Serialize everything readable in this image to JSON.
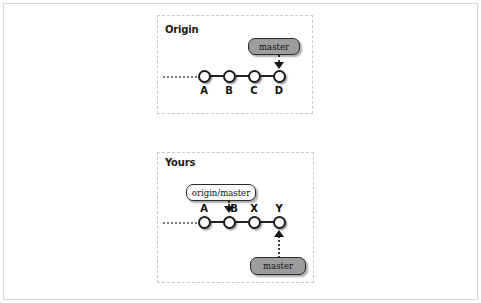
{
  "figure": {
    "width": 481,
    "height": 303,
    "background": "#ffffff",
    "frame_color": "#d8d8d8"
  },
  "colors": {
    "node_fill": "#ffffff",
    "node_stroke": "#1c1c1c",
    "edge": "#222222",
    "pill_filled": "#9d9d9d",
    "pill_hollow": "#fbfbfb",
    "pill_stroke": "#2b2b2b",
    "dashed_group": "#c9c9c9",
    "dotted_pointer": "#3a3a3a",
    "lead_dots": "#7a7a7a",
    "text": "#111111"
  },
  "groups": [
    {
      "id": "origin",
      "title": "Origin",
      "commits": [
        {
          "label": "A"
        },
        {
          "label": "B"
        },
        {
          "label": "C"
        },
        {
          "label": "D"
        }
      ],
      "label_position": "below",
      "refs": [
        {
          "name": "master",
          "style": "filled",
          "points_to": "D",
          "direction": "down"
        }
      ]
    },
    {
      "id": "yours",
      "title": "Yours",
      "commits": [
        {
          "label": "A"
        },
        {
          "label": "B"
        },
        {
          "label": "X"
        },
        {
          "label": "Y"
        }
      ],
      "label_position": "above",
      "refs": [
        {
          "name": "origin/master",
          "style": "hollow",
          "points_to": "B",
          "direction": "down"
        },
        {
          "name": "master",
          "style": "filled",
          "points_to": "Y",
          "direction": "up"
        }
      ]
    }
  ]
}
